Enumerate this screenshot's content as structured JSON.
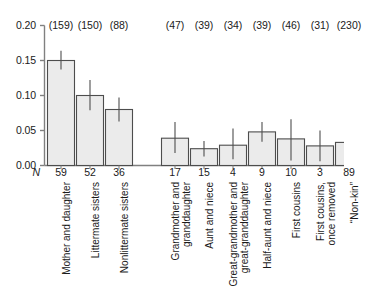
{
  "chart_data": {
    "type": "bar",
    "title": "",
    "subtitle": "",
    "xlabel": "",
    "ylabel": "",
    "ylim": [
      0.0,
      0.2
    ],
    "ytick_labels": [
      "0.00",
      "0.05",
      "0.10",
      "0.15",
      "0.20"
    ],
    "ytick_values": [
      0.0,
      0.05,
      0.1,
      0.15,
      0.2
    ],
    "grid": false,
    "legend": "none",
    "n_row_label": "N",
    "group_gap_after_index": 2,
    "categories": [
      "Mother and daughter",
      "Littermate sisters",
      "Nonlittermate sisters",
      "Grandmother and\ngranddaughter",
      "Aunt and niece",
      "Great-grandmother and\ngreat-granddaughter",
      "Half-aunt and niece",
      "First cousins",
      "First cousins,\nonce removed",
      "“Non-kin”"
    ],
    "values": [
      0.15,
      0.1,
      0.08,
      0.039,
      0.024,
      0.029,
      0.048,
      0.038,
      0.028,
      0.033
    ],
    "error_low": [
      0.137,
      0.079,
      0.063,
      0.018,
      0.013,
      0.009,
      0.034,
      0.007,
      0.006,
      0.01
    ],
    "error_high": [
      0.164,
      0.122,
      0.097,
      0.062,
      0.035,
      0.053,
      0.062,
      0.066,
      0.05,
      0.055
    ],
    "top_labels": [
      "(159)",
      "(150)",
      "(88)",
      "(47)",
      "(39)",
      "(34)",
      "(39)",
      "(46)",
      "(31)",
      "(230)"
    ],
    "n_values": [
      "59",
      "52",
      "36",
      "17",
      "15",
      "4",
      "9",
      "10",
      "3",
      "89"
    ],
    "bar_fill_color": "#ebebeb",
    "bar_edge_color": "#4d4d4d",
    "axis_color": "#808080",
    "error_bar_color": "#4d4d4d"
  }
}
